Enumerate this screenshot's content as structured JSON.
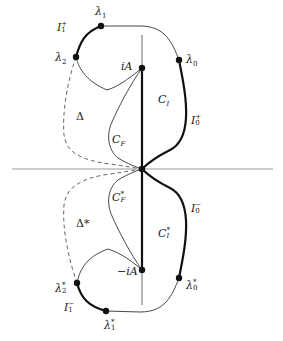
{
  "diagram": {
    "colors": {
      "axis": "#9a9a9a",
      "thin_curve": "#333333",
      "thick_curve": "#111111",
      "dashed_curve": "#555555",
      "point": "#111111"
    },
    "axes": {
      "horizontal": {
        "x1": 12,
        "x2": 273,
        "y": 169
      },
      "vertical": {
        "x": 142,
        "y1": 35,
        "y2": 305
      }
    },
    "points": [
      {
        "id": "origin",
        "x": 142,
        "y": 169
      },
      {
        "id": "iA",
        "x": 142,
        "y": 68
      },
      {
        "id": "neg-iA",
        "x": 142,
        "y": 270
      },
      {
        "id": "lambda1",
        "x": 101,
        "y": 26
      },
      {
        "id": "lambda2",
        "x": 76,
        "y": 57
      },
      {
        "id": "lambda0",
        "x": 179,
        "y": 60
      },
      {
        "id": "lambda0-star",
        "x": 179,
        "y": 278
      },
      {
        "id": "lambda2-star",
        "x": 77,
        "y": 283
      },
      {
        "id": "lambda1-star",
        "x": 106,
        "y": 311
      }
    ],
    "labels": {
      "lambda1": {
        "base": "λ",
        "sub": "1",
        "sup": "",
        "x": 95,
        "y": 6
      },
      "lambda2": {
        "base": "λ",
        "sub": "2",
        "sup": "",
        "x": 55,
        "y": 53
      },
      "lambda0": {
        "base": "λ",
        "sub": "0",
        "sup": "",
        "x": 187,
        "y": 54
      },
      "I1_plus": {
        "base": "I",
        "sub": "1",
        "sup": "+",
        "x": 57,
        "y": 24
      },
      "iA": {
        "text": "iA",
        "x": 121,
        "y": 61
      },
      "C_I": {
        "base": "C",
        "sub": "I",
        "sup": "",
        "x": 158,
        "y": 94
      },
      "I0_plus": {
        "base": "I",
        "sub": "0",
        "sup": "+",
        "x": 191,
        "y": 117
      },
      "Delta": {
        "text": "Δ",
        "x": 76,
        "y": 112
      },
      "C_F": {
        "base": "C",
        "sub": "F",
        "sup": "",
        "x": 112,
        "y": 135
      },
      "C_F_star": {
        "base": "C",
        "sub": "F",
        "sup": "*",
        "x": 112,
        "y": 194
      },
      "Delta_star": {
        "text": "Δ*",
        "x": 76,
        "y": 219
      },
      "C_I_star": {
        "base": "C",
        "sub": "I",
        "sup": "*",
        "x": 158,
        "y": 230
      },
      "I0_minus": {
        "base": "I",
        "sub": "0",
        "sup": "−",
        "x": 191,
        "y": 205
      },
      "neg_iA": {
        "text": "−iA",
        "x": 117,
        "y": 266
      },
      "lambda0_star": {
        "base": "λ",
        "sub": "0",
        "sup": "*",
        "x": 186,
        "y": 281
      },
      "lambda2_star": {
        "base": "λ",
        "sub": "2",
        "sup": "*",
        "x": 55,
        "y": 284
      },
      "I1_minus": {
        "base": "I",
        "sub": "1",
        "sup": "−",
        "x": 64,
        "y": 303
      },
      "lambda1_star": {
        "base": "λ",
        "sub": "1",
        "sup": "*",
        "x": 104,
        "y": 321
      }
    }
  }
}
